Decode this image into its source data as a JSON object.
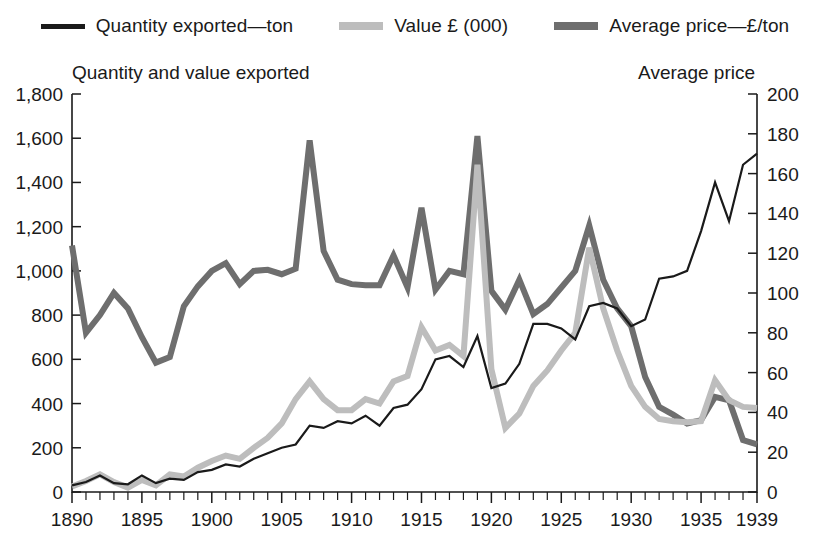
{
  "legend": {
    "items": [
      {
        "label": "Quantity exported—ton",
        "color": "#1a1a1a",
        "weight": "thin",
        "swatch_name": "legend-swatch-quantity"
      },
      {
        "label": "Value £ (000)",
        "color": "#bdbdbd",
        "weight": "thick",
        "swatch_name": "legend-swatch-value"
      },
      {
        "label": "Average price—£/ton",
        "color": "#6e6e6e",
        "weight": "thick",
        "swatch_name": "legend-swatch-price"
      }
    ]
  },
  "headers": {
    "left": "Quantity and value exported",
    "right": "Average price"
  },
  "chart_data": {
    "type": "line",
    "title": "",
    "xlabel": "",
    "ylabel": "Quantity and value exported",
    "y2label": "Average price",
    "xlim": [
      1890,
      1939
    ],
    "ylim": [
      0,
      1800
    ],
    "y2lim": [
      0,
      200
    ],
    "grid": false,
    "legend_position": "top",
    "x_ticklabels": [
      "1890",
      "1895",
      "1900",
      "1905",
      "1910",
      "1915",
      "1920",
      "1925",
      "1930",
      "1935",
      "1939"
    ],
    "x_tickvalues": [
      1890,
      1895,
      1900,
      1905,
      1910,
      1915,
      1920,
      1925,
      1930,
      1935,
      1939
    ],
    "x_minor_step": 1,
    "y_ticklabels": [
      "0",
      "200",
      "400",
      "600",
      "800",
      "1,000",
      "1,200",
      "1,400",
      "1,600",
      "1,800"
    ],
    "y_tickvalues": [
      0,
      200,
      400,
      600,
      800,
      1000,
      1200,
      1400,
      1600,
      1800
    ],
    "y2_ticklabels": [
      "0",
      "20",
      "40",
      "60",
      "80",
      "100",
      "120",
      "140",
      "160",
      "180",
      "200"
    ],
    "y2_tickvalues": [
      0,
      20,
      40,
      60,
      80,
      100,
      120,
      140,
      160,
      180,
      200
    ],
    "x": [
      1890,
      1891,
      1892,
      1893,
      1894,
      1895,
      1896,
      1897,
      1898,
      1899,
      1900,
      1901,
      1902,
      1903,
      1904,
      1905,
      1906,
      1907,
      1908,
      1909,
      1910,
      1911,
      1912,
      1913,
      1914,
      1915,
      1916,
      1917,
      1918,
      1919,
      1920,
      1921,
      1922,
      1923,
      1924,
      1925,
      1926,
      1927,
      1928,
      1929,
      1930,
      1931,
      1932,
      1933,
      1934,
      1935,
      1936,
      1937,
      1938,
      1939
    ],
    "series": [
      {
        "name": "Quantity exported—ton",
        "axis": "left",
        "color": "#1a1a1a",
        "width": 2.2,
        "values": [
          30,
          45,
          75,
          40,
          35,
          75,
          40,
          60,
          55,
          90,
          100,
          125,
          115,
          150,
          175,
          200,
          215,
          300,
          290,
          320,
          310,
          345,
          300,
          380,
          395,
          465,
          600,
          615,
          565,
          705,
          470,
          490,
          580,
          760,
          760,
          740,
          690,
          840,
          855,
          830,
          750,
          780,
          965,
          975,
          1000,
          1180,
          1400,
          1225,
          1480,
          1530
        ]
      },
      {
        "name": "Value £ (000)",
        "axis": "left",
        "color": "#bdbdbd",
        "width": 6,
        "values": [
          25,
          50,
          80,
          45,
          20,
          55,
          30,
          80,
          70,
          110,
          140,
          165,
          150,
          200,
          245,
          310,
          420,
          500,
          420,
          370,
          370,
          420,
          400,
          500,
          525,
          745,
          640,
          665,
          615,
          1480,
          555,
          290,
          355,
          480,
          550,
          640,
          720,
          1105,
          830,
          640,
          480,
          385,
          330,
          320,
          315,
          320,
          505,
          415,
          385,
          380
        ]
      },
      {
        "name": "Average price—£/ton",
        "axis": "right",
        "color": "#6e6e6e",
        "width": 6,
        "values": [
          1115,
          720,
          800,
          900,
          830,
          700,
          585,
          610,
          840,
          930,
          1000,
          1035,
          940,
          1000,
          1005,
          985,
          1010,
          1590,
          1090,
          960,
          940,
          935,
          935,
          1070,
          925,
          1285,
          915,
          1000,
          985,
          1610,
          910,
          825,
          960,
          805,
          850,
          925,
          1000,
          1205,
          960,
          830,
          750,
          520,
          385,
          350,
          310,
          325,
          430,
          415,
          235,
          215
        ]
      }
    ]
  }
}
